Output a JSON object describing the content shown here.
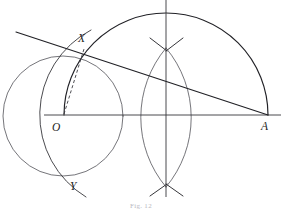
{
  "figure": {
    "kind": "geometric-construction-diagram",
    "caption": "Fig. 12",
    "colors": {
      "ink": "#2b2b2f",
      "ink_light": "#3a3a40",
      "ink_heavy": "#212126",
      "background": "#ffffff",
      "caption": "#b9b9bf"
    },
    "labels": [
      {
        "name": "point-label-x",
        "text": "X",
        "x": 78,
        "y": 42
      },
      {
        "name": "point-label-o",
        "text": "O",
        "x": 52,
        "y": 131
      },
      {
        "name": "point-label-a",
        "text": "A",
        "x": 261,
        "y": 130
      },
      {
        "name": "point-label-y",
        "text": "Y",
        "x": 70,
        "y": 190
      }
    ],
    "points": {
      "O": {
        "x": 63,
        "y": 115
      },
      "A": {
        "x": 267,
        "y": 115
      },
      "X": {
        "x": 84,
        "y": 49
      },
      "Y": {
        "x": 78,
        "y": 181
      },
      "M": {
        "x": 166,
        "y": 115
      },
      "bisector_top": {
        "x": 166,
        "y": 50
      },
      "bisector_bottom": {
        "x": 166,
        "y": 185
      }
    },
    "axis": {
      "name": "horizontal-axis",
      "x1": 44,
      "x2": 281,
      "y": 115
    },
    "vertical_bisector": {
      "name": "perpendicular-bisector",
      "x": 166,
      "y1": 0,
      "y2": 197
    },
    "circle_center_O": {
      "name": "circle-center-o",
      "cx": 63,
      "cy": 116,
      "r": 60
    },
    "semicircle_OA": {
      "name": "semicircle-on-oa",
      "cx": 166,
      "cy": 115,
      "r": 102
    },
    "arc_through_XY": {
      "name": "arc-through-x-y",
      "cx": 175,
      "cy": 115,
      "r": 96
    },
    "secant_line": {
      "name": "secant-line-a-x",
      "x1": 16,
      "y1": 32,
      "x2": 268,
      "y2": 115
    },
    "dashed_radius": {
      "name": "dashed-segment-o-x",
      "x1": 64,
      "y1": 114,
      "x2": 84,
      "y2": 49
    },
    "bisector_arcs": [
      {
        "name": "bisector-arc-left",
        "cx": 74,
        "cy": 117,
        "r": 108
      },
      {
        "name": "bisector-arc-right",
        "cx": 258,
        "cy": 117,
        "r": 108
      }
    ],
    "tick_marks": [
      {
        "name": "tick-top-left",
        "x1": 150,
        "y1": 38,
        "x2": 167,
        "y2": 51
      },
      {
        "name": "tick-top-right",
        "x1": 183,
        "y1": 38,
        "x2": 166,
        "y2": 51
      },
      {
        "name": "tick-bottom-left",
        "x1": 150,
        "y1": 196,
        "x2": 167,
        "y2": 184
      },
      {
        "name": "tick-bottom-right",
        "x1": 183,
        "y1": 196,
        "x2": 166,
        "y2": 184
      }
    ]
  }
}
